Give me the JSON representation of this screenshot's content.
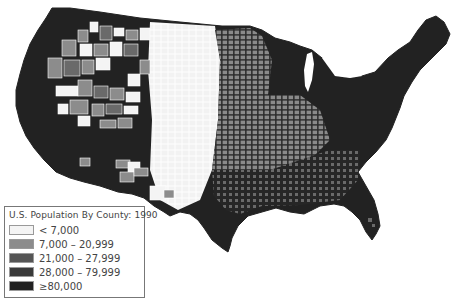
{
  "map": {
    "type": "choropleth",
    "region": "Contiguous United States",
    "unit": "county",
    "background": "#ffffff",
    "county_border_color": "#ffffff"
  },
  "legend": {
    "title": "U.S. Population By County: 1990",
    "items": [
      {
        "label": "< 7,000",
        "color": "#f4f4f4"
      },
      {
        "label": "7,000 – 20,999",
        "color": "#8c8c8c"
      },
      {
        "label": "21,000 – 27,999",
        "color": "#555555"
      },
      {
        "label": "28,000 – 79,999",
        "color": "#3a3a3a"
      },
      {
        "label": "≥80,000",
        "color": "#222222"
      }
    ]
  }
}
